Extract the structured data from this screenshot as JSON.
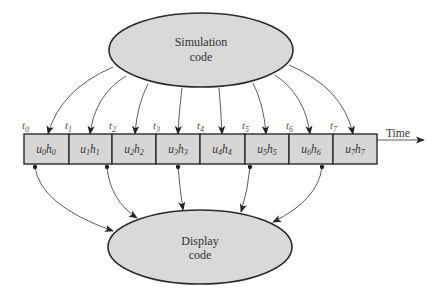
{
  "diagram": {
    "source_node": {
      "line1": "Simulation",
      "line2": "code"
    },
    "sink_node": {
      "line1": "Display",
      "line2": "code"
    },
    "time_axis_label": "Time",
    "time_labels": [
      "t",
      "t",
      "t",
      "t",
      "t",
      "t",
      "t",
      "t"
    ],
    "time_label_subscripts": [
      "0",
      "1",
      "2",
      "3",
      "4",
      "5",
      "6",
      "7"
    ],
    "cells": [
      {
        "u": "u",
        "u_sub": "0",
        "h": "h",
        "h_sub": "0"
      },
      {
        "u": "u",
        "u_sub": "1",
        "h": "h",
        "h_sub": "1"
      },
      {
        "u": "u",
        "u_sub": "2",
        "h": "h",
        "h_sub": "2"
      },
      {
        "u": "u",
        "u_sub": "3",
        "h": "h",
        "h_sub": "3"
      },
      {
        "u": "u",
        "u_sub": "4",
        "h": "h",
        "h_sub": "4"
      },
      {
        "u": "u",
        "u_sub": "5",
        "h": "h",
        "h_sub": "5"
      },
      {
        "u": "u",
        "u_sub": "6",
        "h": "h",
        "h_sub": "6"
      },
      {
        "u": "u",
        "u_sub": "7",
        "h": "h",
        "h_sub": "7"
      }
    ],
    "displayed_cells": [
      0,
      1,
      3,
      5,
      6
    ],
    "colors": {
      "fill": "#d6d6d6",
      "stroke": "#2b2b2b",
      "text": "#333333"
    }
  }
}
